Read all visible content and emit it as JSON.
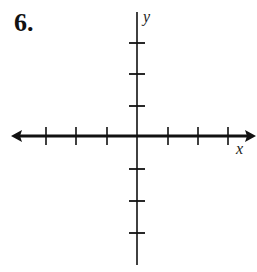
{
  "problem": {
    "number": "6."
  },
  "axes": {
    "x_label": "x",
    "y_label": "y",
    "x_ticks_left": 3,
    "x_ticks_right": 3,
    "y_ticks_up": 3,
    "y_ticks_down": 3,
    "line_color": "#111111"
  }
}
